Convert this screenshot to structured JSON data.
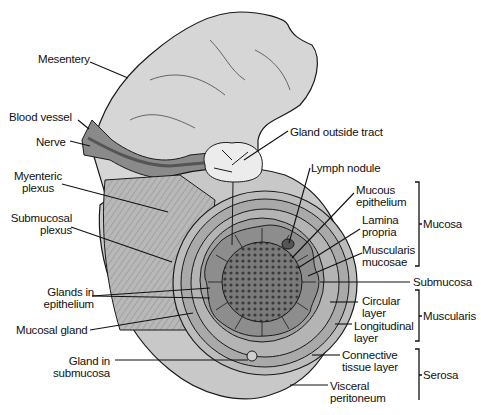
{
  "diagram": {
    "colors": {
      "tissue_light": "#d9d9d9",
      "tissue_mid": "#a8a8a8",
      "tissue_dark": "#6e6e6e",
      "line": "#1a1a1a",
      "background": "#ffffff"
    },
    "left_labels": {
      "mesentery": "Mesentery",
      "blood_vessel": "Blood vessel",
      "nerve": "Nerve",
      "myenteric_1": "Myenteric",
      "myenteric_2": "plexus",
      "submucosal_1": "Submucosal",
      "submucosal_2": "plexus",
      "glands_epi_1": "Glands in",
      "glands_epi_2": "epithelium",
      "mucosal_gland": "Mucosal gland",
      "gland_sub_1": "Gland in",
      "gland_sub_2": "submucosa"
    },
    "right_labels": {
      "gland_outside": "Gland outside tract",
      "lymph_nodule": "Lymph nodule",
      "mucous_epi_1": "Mucous",
      "mucous_epi_2": "epithelium",
      "lamina_1": "Lamina",
      "lamina_2": "propria",
      "muscularis_muc_1": "Muscularis",
      "muscularis_muc_2": "mucosae",
      "circular_1": "Circular",
      "circular_2": "layer",
      "longitudinal_1": "Longitudinal",
      "longitudinal_2": "layer",
      "connective_1": "Connective",
      "connective_2": "tissue layer",
      "visceral_1": "Visceral",
      "visceral_2": "peritoneum"
    },
    "groups": {
      "mucosa": "Mucosa",
      "submucosa": "Submucosa",
      "muscularis": "Muscularis",
      "serosa": "Serosa"
    }
  }
}
